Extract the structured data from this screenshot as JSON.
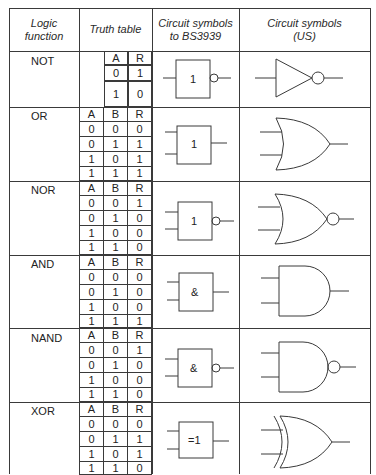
{
  "headers": {
    "logic_function": "Logic function",
    "logic_function_l1": "Logic",
    "logic_function_l2": "function",
    "truth_table": "Truth table",
    "bs_l1": "Circuit symbols",
    "bs_l2": "to BS3939",
    "us_l1": "Circuit symbols",
    "us_l2": "(US)"
  },
  "rows": [
    {
      "name": "NOT",
      "bs_label": "1",
      "inputs": [
        "A"
      ],
      "output": "R",
      "table": [
        [
          "0",
          "1"
        ],
        [
          "1",
          "0"
        ]
      ],
      "inverted": true
    },
    {
      "name": "OR",
      "bs_label": "1",
      "inputs": [
        "A",
        "B"
      ],
      "output": "R",
      "table": [
        [
          "0",
          "0",
          "0"
        ],
        [
          "0",
          "1",
          "1"
        ],
        [
          "1",
          "0",
          "1"
        ],
        [
          "1",
          "1",
          "1"
        ]
      ],
      "inverted": false
    },
    {
      "name": "NOR",
      "bs_label": "1",
      "inputs": [
        "A",
        "B"
      ],
      "output": "R",
      "table": [
        [
          "0",
          "0",
          "1"
        ],
        [
          "0",
          "1",
          "0"
        ],
        [
          "1",
          "0",
          "0"
        ],
        [
          "1",
          "1",
          "0"
        ]
      ],
      "inverted": true
    },
    {
      "name": "AND",
      "bs_label": "&",
      "inputs": [
        "A",
        "B"
      ],
      "output": "R",
      "table": [
        [
          "0",
          "0",
          "0"
        ],
        [
          "0",
          "1",
          "0"
        ],
        [
          "1",
          "0",
          "0"
        ],
        [
          "1",
          "1",
          "1"
        ]
      ],
      "inverted": false
    },
    {
      "name": "NAND",
      "bs_label": "&",
      "inputs": [
        "A",
        "B"
      ],
      "output": "R",
      "table": [
        [
          "0",
          "0",
          "1"
        ],
        [
          "0",
          "1",
          "0"
        ],
        [
          "1",
          "0",
          "0"
        ],
        [
          "1",
          "1",
          "0"
        ]
      ],
      "inverted": true
    },
    {
      "name": "XOR",
      "bs_label": "=1",
      "inputs": [
        "A",
        "B"
      ],
      "output": "R",
      "table": [
        [
          "0",
          "0",
          "0"
        ],
        [
          "0",
          "1",
          "1"
        ],
        [
          "1",
          "0",
          "1"
        ],
        [
          "1",
          "1",
          "0"
        ]
      ],
      "inverted": false
    }
  ],
  "icons": {
    "not_us": "not-gate-us-symbol",
    "or_us": "or-gate-us-symbol",
    "nor_us": "nor-gate-us-symbol",
    "and_us": "and-gate-us-symbol",
    "nand_us": "nand-gate-us-symbol",
    "xor_us": "xor-gate-us-symbol"
  },
  "colors": {
    "line": "#3a3a3a",
    "text": "#222222",
    "background": "#ffffff"
  }
}
